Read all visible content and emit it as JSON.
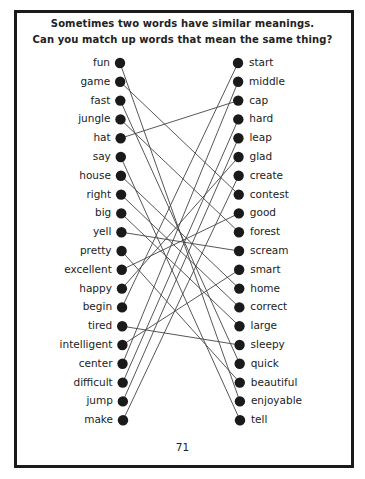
{
  "title": {
    "line1": "Sometimes two words have similar meanings.",
    "line2": "Can you match up words that mean the same thing?"
  },
  "left_words": [
    "fun",
    "game",
    "fast",
    "jungle",
    "hat",
    "say",
    "house",
    "right",
    "big",
    "yell",
    "pretty",
    "excellent",
    "happy",
    "begin",
    "tired",
    "intelligent",
    "center",
    "difficult",
    "jump",
    "make"
  ],
  "right_words": [
    "start",
    "middle",
    "cap",
    "hard",
    "leap",
    "glad",
    "create",
    "contest",
    "good",
    "forest",
    "scream",
    "smart",
    "home",
    "correct",
    "large",
    "sleepy",
    "quick",
    "beautiful",
    "enjoyable",
    "tell"
  ],
  "matches": [
    {
      "left": "fun",
      "right": "enjoyable"
    },
    {
      "left": "game",
      "right": "contest"
    },
    {
      "left": "fast",
      "right": "quick"
    },
    {
      "left": "jungle",
      "right": "forest"
    },
    {
      "left": "hat",
      "right": "cap"
    },
    {
      "left": "say",
      "right": "tell"
    },
    {
      "left": "house",
      "right": "home"
    },
    {
      "left": "right",
      "right": "correct"
    },
    {
      "left": "big",
      "right": "large"
    },
    {
      "left": "yell",
      "right": "scream"
    },
    {
      "left": "pretty",
      "right": "beautiful"
    },
    {
      "left": "excellent",
      "right": "good"
    },
    {
      "left": "happy",
      "right": "glad"
    },
    {
      "left": "begin",
      "right": "start"
    },
    {
      "left": "tired",
      "right": "sleepy"
    },
    {
      "left": "intelligent",
      "right": "smart"
    },
    {
      "left": "center",
      "right": "middle"
    },
    {
      "left": "difficult",
      "right": "hard"
    },
    {
      "left": "jump",
      "right": "leap"
    },
    {
      "left": "make",
      "right": "create"
    }
  ],
  "page_number": "71",
  "colors": {
    "ink": "#1a1a1a",
    "line": "#444444",
    "background": "#ffffff"
  }
}
